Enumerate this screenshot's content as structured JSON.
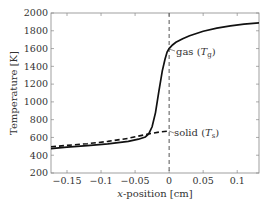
{
  "chart_data": {
    "type": "line",
    "title": "",
    "xlabel": "x-position [cm]",
    "ylabel": "Temperature [K]",
    "xlim": [
      -0.1735,
      0.132
    ],
    "ylim": [
      200,
      2000
    ],
    "grid": false,
    "x_ticks": [
      -0.15,
      -0.1,
      -0.05,
      0,
      0.05,
      0.1
    ],
    "x_tick_labels": [
      "−0.15",
      "−0.1",
      "−0.05",
      "0",
      "0.05",
      "0.1"
    ],
    "y_ticks": [
      200,
      400,
      600,
      800,
      1000,
      1200,
      1400,
      1600,
      1800,
      2000
    ],
    "y_tick_labels": [
      "200",
      "400",
      "600",
      "800",
      "1000",
      "1200",
      "1400",
      "1600",
      "1800",
      "2000"
    ],
    "series": [
      {
        "name": "gas (T_g)",
        "style": "solid",
        "x": [
          -0.1735,
          -0.15,
          -0.12,
          -0.09,
          -0.06,
          -0.045,
          -0.035,
          -0.03,
          -0.025,
          -0.02,
          -0.015,
          -0.01,
          -0.006,
          -0.003,
          0,
          0.005,
          0.01,
          0.02,
          0.03,
          0.05,
          0.07,
          0.09,
          0.11,
          0.132
        ],
        "values": [
          475,
          490,
          508,
          528,
          555,
          580,
          605,
          640,
          720,
          880,
          1120,
          1350,
          1480,
          1560,
          1600,
          1640,
          1670,
          1710,
          1745,
          1795,
          1830,
          1855,
          1875,
          1890
        ]
      },
      {
        "name": "solid (T_s)",
        "style": "dashed",
        "x": [
          -0.1735,
          -0.15,
          -0.12,
          -0.09,
          -0.06,
          -0.03,
          -0.015,
          0
        ],
        "values": [
          495,
          510,
          530,
          555,
          590,
          640,
          660,
          672
        ]
      }
    ],
    "annotations": [
      {
        "text": "gas (T_g)",
        "x": 0,
        "y": 1600
      },
      {
        "text": "solid (T_s)",
        "x": 0,
        "y": 672
      }
    ],
    "reference_lines": [
      {
        "orientation": "vertical",
        "x": 0,
        "style": "dashed"
      }
    ],
    "legend": "none (inline annotations)"
  },
  "labels": {
    "xlabel_var": "x",
    "xlabel_rest": "-position [cm]",
    "ylabel": "Temperature [K]",
    "gas_text": "gas (",
    "gas_var": "T",
    "gas_sub": "g",
    "solid_text": "solid (",
    "solid_var": "T",
    "solid_sub": "s",
    "close_paren": ")"
  }
}
